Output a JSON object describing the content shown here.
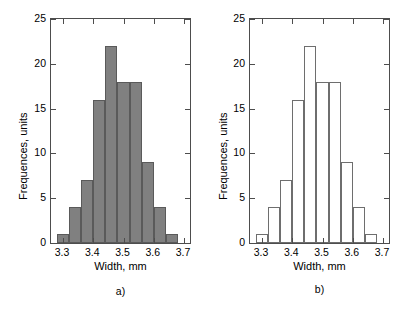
{
  "chart_data": [
    {
      "type": "bar",
      "panel_label": "a)",
      "style": "filled-gray",
      "fill_color": "#808080",
      "edge_color": "#5a5a5a",
      "title": "",
      "xlabel": "Width, mm",
      "ylabel": "Frequences, units",
      "xlim": [
        3.26,
        3.72
      ],
      "ylim": [
        0,
        25
      ],
      "grid": false,
      "legend": "none",
      "xticks": [
        3.3,
        3.4,
        3.5,
        3.6,
        3.7
      ],
      "xtick_labels": [
        "3.3",
        "3.4",
        "3.5",
        "3.6",
        "3.7"
      ],
      "yticks": [
        0,
        5,
        10,
        15,
        20,
        25
      ],
      "ytick_labels": [
        "0",
        "5",
        "10",
        "15",
        "20",
        "25"
      ],
      "bin_edges": [
        3.28,
        3.32,
        3.36,
        3.4,
        3.44,
        3.48,
        3.52,
        3.56,
        3.6,
        3.64,
        3.68
      ],
      "bin_centers": [
        3.3,
        3.34,
        3.38,
        3.42,
        3.46,
        3.5,
        3.54,
        3.58,
        3.62,
        3.66
      ],
      "categories": [
        "3.30",
        "3.34",
        "3.38",
        "3.42",
        "3.46",
        "3.50",
        "3.54",
        "3.58",
        "3.62",
        "3.66"
      ],
      "values": [
        1,
        4,
        7,
        16,
        22,
        18,
        18,
        9,
        4,
        1
      ]
    },
    {
      "type": "bar",
      "panel_label": "b)",
      "style": "outline-white",
      "fill_color": "#ffffff",
      "edge_color": "#6e6e6e",
      "title": "",
      "xlabel": "Width, mm",
      "ylabel": "Frequences, units",
      "xlim": [
        3.26,
        3.72
      ],
      "ylim": [
        0,
        25
      ],
      "grid": false,
      "legend": "none",
      "xticks": [
        3.3,
        3.4,
        3.5,
        3.6,
        3.7
      ],
      "xtick_labels": [
        "3.3",
        "3.4",
        "3.5",
        "3.6",
        "3.7"
      ],
      "yticks": [
        0,
        5,
        10,
        15,
        20,
        25
      ],
      "ytick_labels": [
        "0",
        "5",
        "10",
        "15",
        "20",
        "25"
      ],
      "bin_edges": [
        3.28,
        3.32,
        3.36,
        3.4,
        3.44,
        3.48,
        3.52,
        3.56,
        3.6,
        3.64,
        3.68
      ],
      "bin_centers": [
        3.3,
        3.34,
        3.38,
        3.42,
        3.46,
        3.5,
        3.54,
        3.58,
        3.62,
        3.66
      ],
      "categories": [
        "3.30",
        "3.34",
        "3.38",
        "3.42",
        "3.46",
        "3.50",
        "3.54",
        "3.58",
        "3.62",
        "3.66"
      ],
      "values": [
        1,
        4,
        7,
        16,
        22,
        18,
        18,
        9,
        4,
        1
      ]
    }
  ],
  "panels": [
    {
      "key": "a",
      "caption": "a)",
      "xlabel": "Width, mm",
      "ylabel": "Frequences, units"
    },
    {
      "key": "b",
      "caption": "b)",
      "xlabel": "Width, mm",
      "ylabel": "Frequences, units"
    }
  ],
  "axis_color": "#4d4d4d"
}
